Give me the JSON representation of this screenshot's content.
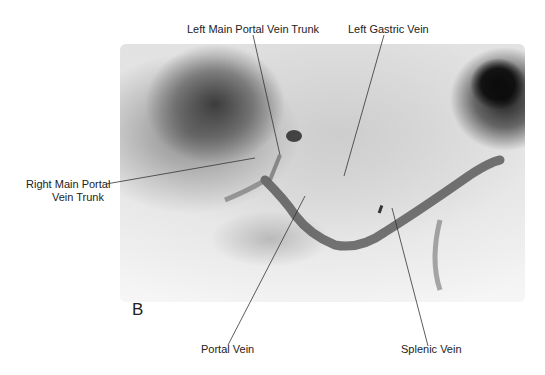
{
  "figure": {
    "panel_letter": "B",
    "image_description": "Portal venogram radiograph (grayscale)",
    "labels": {
      "left_main_portal_vein_trunk": "Left Main Portal Vein Trunk",
      "left_gastric_vein": "Left Gastric Vein",
      "right_main_portal_vein_trunk_line1": "Right Main Portal",
      "right_main_portal_vein_trunk_line2": "Vein Trunk",
      "portal_vein": "Portal Vein",
      "splenic_vein": "Splenic Vein"
    }
  }
}
